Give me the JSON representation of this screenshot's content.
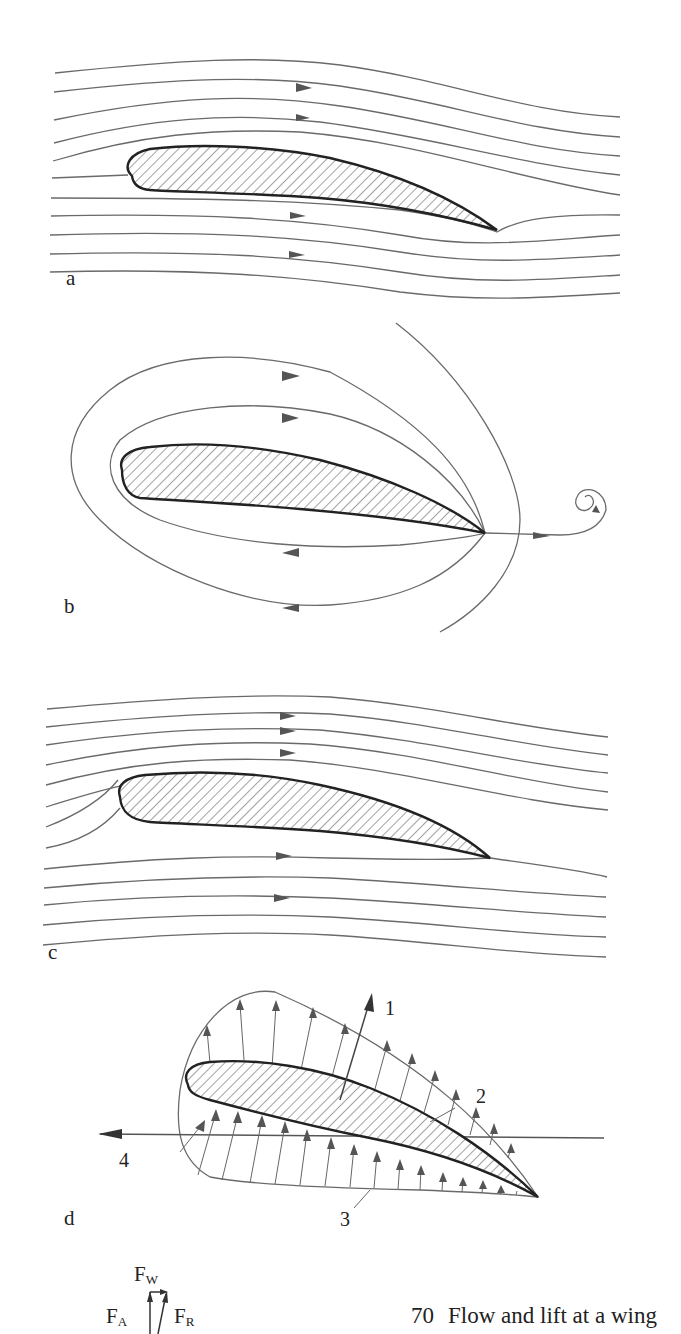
{
  "figure": {
    "number": "70",
    "caption": "Flow and lift at a wing",
    "panels": [
      {
        "id": "a",
        "label": "a",
        "description": "Potential flow around airfoil without circulation; rear stagnation point on upper surface"
      },
      {
        "id": "b",
        "label": "b",
        "description": "Circulation flow around airfoil with starting vortex shed from trailing edge"
      },
      {
        "id": "c",
        "label": "c",
        "description": "Superposition: flow with circulation, smooth departure at trailing edge"
      },
      {
        "id": "d",
        "label": "d",
        "description": "Pressure distribution around airfoil with lift and drag vectors"
      }
    ],
    "panel_d_labels": {
      "l1": "1",
      "l2": "2",
      "l3": "3",
      "l4": "4"
    },
    "force_legend": {
      "fw_main": "F",
      "fw_sub": "W",
      "fa_main": "F",
      "fa_sub": "A",
      "fr_main": "F",
      "fr_sub": "R"
    }
  },
  "colors": {
    "line": "#6a6a6a",
    "outline": "#222222",
    "background": "#ffffff"
  }
}
